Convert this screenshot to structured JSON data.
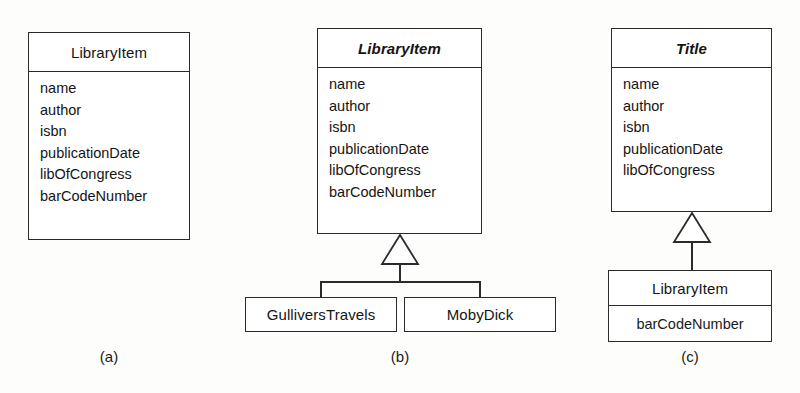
{
  "figure": {
    "notation": "uml-class-diagram",
    "panels": [
      {
        "caption": "(a)",
        "classes": [
          {
            "name": "LibraryItem",
            "abstract": false,
            "attributes": [
              "name",
              "author",
              "isbn",
              "publicationDate",
              "libOfCongress",
              "barCodeNumber"
            ]
          }
        ]
      },
      {
        "caption": "(b)",
        "classes": [
          {
            "name": "LibraryItem",
            "abstract": true,
            "attributes": [
              "name",
              "author",
              "isbn",
              "publicationDate",
              "libOfCongress",
              "barCodeNumber"
            ]
          },
          {
            "name": "GulliversTravels",
            "abstract": false,
            "attributes": []
          },
          {
            "name": "MobyDick",
            "abstract": false,
            "attributes": []
          }
        ]
      },
      {
        "caption": "(c)",
        "classes": [
          {
            "name": "Title",
            "abstract": true,
            "attributes": [
              "name",
              "author",
              "isbn",
              "publicationDate",
              "libOfCongress"
            ]
          },
          {
            "name": "LibraryItem",
            "abstract": false,
            "attributes": [
              "barCodeNumber"
            ]
          }
        ]
      }
    ]
  },
  "panel_a": {
    "class_name": "LibraryItem",
    "attr_0": "name",
    "attr_1": "author",
    "attr_2": "isbn",
    "attr_3": "publicationDate",
    "attr_4": "libOfCongress",
    "attr_5": "barCodeNumber",
    "caption": "(a)"
  },
  "panel_b": {
    "class_name": "LibraryItem",
    "attr_0": "name",
    "attr_1": "author",
    "attr_2": "isbn",
    "attr_3": "publicationDate",
    "attr_4": "libOfCongress",
    "attr_5": "barCodeNumber",
    "sub_left": "GulliversTravels",
    "sub_right": "MobyDick",
    "caption": "(b)"
  },
  "panel_c": {
    "class_name": "Title",
    "attr_0": "name",
    "attr_1": "author",
    "attr_2": "isbn",
    "attr_3": "publicationDate",
    "attr_4": "libOfCongress",
    "sub_name": "LibraryItem",
    "sub_attr_0": "barCodeNumber",
    "caption": "(c)"
  },
  "colors": {
    "line": "#2b2b2b",
    "text": "#1a1a1a",
    "background": "#fdfdfb",
    "box_fill": "#ffffff"
  }
}
